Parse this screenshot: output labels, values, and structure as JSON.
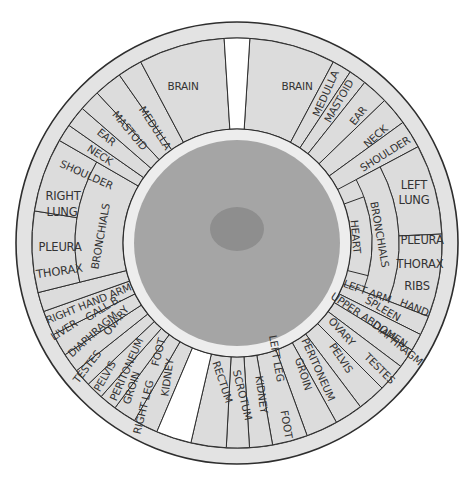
{
  "chart_data": {
    "type": "iris-zone-chart",
    "center": [
      237,
      243
    ],
    "radii": {
      "rim_outer": 221,
      "ring_outer": 205,
      "ring_inner": 114,
      "iris": 103,
      "pupil_rx": 27,
      "pupil_ry": 22
    },
    "colors": {
      "rim": "#e3e3e3",
      "segment": "#dcdcdc",
      "gap": "#ffffff",
      "iris_ring": "#ededed",
      "iris": "#a5a5a5",
      "pupil": "#8e8e8e",
      "line": "#2e2e2e",
      "text": "#333333"
    },
    "gaps": [
      {
        "name": "top-gap",
        "a0": -3.6,
        "a1": 3.6
      },
      {
        "name": "bottom-gap",
        "a0": 193,
        "a1": 203
      }
    ],
    "right_half": [
      {
        "label": "BRAIN",
        "a0": 3.6,
        "a1": 28,
        "r0": 114,
        "r1": 205
      },
      {
        "label": "MEDULLA",
        "a0": 28,
        "a1": 33.5,
        "r0": 114,
        "r1": 205
      },
      {
        "label": "MASTOID",
        "a0": 33.5,
        "a1": 38.5,
        "r0": 114,
        "r1": 205
      },
      {
        "label": "EAR",
        "a0": 38.5,
        "a1": 46,
        "r0": 114,
        "r1": 205
      },
      {
        "label": "NECK",
        "a0": 46,
        "a1": 54,
        "r0": 114,
        "r1": 205
      },
      {
        "label": "SHOULDER",
        "a0": 54,
        "a1": 62,
        "r0": 114,
        "r1": 205
      },
      {
        "label": "LEFT LUNG",
        "a0": 62,
        "a1": 87.5,
        "r0": 162,
        "r1": 205
      },
      {
        "label": "PLEURA THORAX RIBS",
        "a0": 87.5,
        "a1": 111,
        "r0": 162,
        "r1": 205
      },
      {
        "label": "BRONCHIALS",
        "a0": 62,
        "a1": 111,
        "r0": 135,
        "r1": 162
      },
      {
        "label": "HEART",
        "a0": 70,
        "a1": 104,
        "r0": 114,
        "r1": 135
      },
      {
        "label": "LEFT ARM / HAND",
        "a0": 111,
        "a1": 116.5,
        "r0": 114,
        "r1": 205
      },
      {
        "label": "SPLEEN",
        "a0": 116.5,
        "a1": 121.5,
        "r0": 114,
        "r1": 205
      },
      {
        "label": "UPPER ABDOMEN / DIAPHRAGM",
        "a0": 121.5,
        "a1": 127,
        "r0": 114,
        "r1": 205
      },
      {
        "label": "OVARY / TESTES",
        "a0": 127,
        "a1": 135,
        "r0": 114,
        "r1": 205
      },
      {
        "label": "PELVIS",
        "a0": 135,
        "a1": 143,
        "r0": 114,
        "r1": 205
      },
      {
        "label": "PERITONEUM",
        "a0": 143,
        "a1": 151,
        "r0": 114,
        "r1": 205
      },
      {
        "label": "GROIN",
        "a0": 151,
        "a1": 160,
        "r0": 114,
        "r1": 205
      },
      {
        "label": "LEFT LEG / FOOT",
        "a0": 160,
        "a1": 170,
        "r0": 114,
        "r1": 205
      },
      {
        "label": "KIDNEY",
        "a0": 170,
        "a1": 176.5,
        "r0": 114,
        "r1": 205
      },
      {
        "label": "SCROTUM",
        "a0": 176.5,
        "a1": 183,
        "r0": 114,
        "r1": 205
      },
      {
        "label": "RECTUM",
        "a0": 183,
        "a1": 193,
        "r0": 114,
        "r1": 205
      }
    ],
    "left_half": [
      {
        "label": "KIDNEY",
        "a0": 203,
        "a1": 210,
        "r0": 114,
        "r1": 205
      },
      {
        "label": "RIGHT LEG / FOOT",
        "a0": 210,
        "a1": 216.5,
        "r0": 114,
        "r1": 205
      },
      {
        "label": "GROIN",
        "a0": 216.5,
        "a1": 221.5,
        "r0": 114,
        "r1": 205
      },
      {
        "label": "PERITONEUM",
        "a0": 221.5,
        "a1": 226.5,
        "r0": 114,
        "r1": 205
      },
      {
        "label": "PELVIS",
        "a0": 226.5,
        "a1": 231.5,
        "r0": 114,
        "r1": 205
      },
      {
        "label": "TESTES / OVARY",
        "a0": 231.5,
        "a1": 237,
        "r0": 114,
        "r1": 205
      },
      {
        "label": "DIAPHRAGM",
        "a0": 237,
        "a1": 243.5,
        "r0": 114,
        "r1": 205
      },
      {
        "label": "LIVER / GALL B.",
        "a0": 243.5,
        "a1": 250.5,
        "r0": 114,
        "r1": 205
      },
      {
        "label": "RIGHT HAND ARM",
        "a0": 250.5,
        "a1": 256,
        "r0": 114,
        "r1": 205
      },
      {
        "label": "PLEURA THORAX",
        "a0": 256,
        "a1": 279,
        "r0": 162,
        "r1": 205
      },
      {
        "label": "RIGHT LUNG",
        "a0": 279,
        "a1": 300,
        "r0": 162,
        "r1": 205
      },
      {
        "label": "BRONCHIALS",
        "a0": 256,
        "a1": 300,
        "r0": 114,
        "r1": 162
      },
      {
        "label": "SHOULDER",
        "a0": 300,
        "a1": 305,
        "r0": 114,
        "r1": 205
      },
      {
        "label": "NECK",
        "a0": 305,
        "a1": 311,
        "r0": 114,
        "r1": 205
      },
      {
        "label": "EAR",
        "a0": 311,
        "a1": 317,
        "r0": 114,
        "r1": 205
      },
      {
        "label": "MASTOID",
        "a0": 317,
        "a1": 325,
        "r0": 114,
        "r1": 205
      },
      {
        "label": "MEDULLA",
        "a0": 325,
        "a1": 332,
        "r0": 114,
        "r1": 205
      },
      {
        "label": "BRAIN",
        "a0": 332,
        "a1": 356.4,
        "r0": 114,
        "r1": 205
      }
    ]
  },
  "labels": {
    "brain_left": "BRAIN",
    "brain_right": "BRAIN",
    "medulla_l": "MEDULLA",
    "mastoid_l": "MASTOID",
    "ear_l": "EAR",
    "neck_l": "NECK",
    "shoulder_l": "SHOULDER",
    "right_lung_1": "RIGHT",
    "right_lung_2": "LUNG",
    "pleura_l": "PLEURA",
    "thorax_l": "THORAX",
    "bronchials_l": "BRONCHIALS",
    "right_hand_arm": "RIGHT HAND ARM",
    "liver": "LIVER",
    "gall_b": "GALL B.",
    "diaphragm_l": "DIAPHRAGM",
    "testes_l": "TESTES",
    "ovary_l": "OVARY",
    "pelvis_l": "PELVIS",
    "peritoneum_l": "PERITONEUM",
    "groin_l": "GROIN",
    "right_leg": "RIGHT LEG",
    "foot_l": "FOOT",
    "kidney_l": "KIDNEY",
    "medulla_r": "MEDULLA",
    "mastoid_r": "MASTOID",
    "ear_r": "EAR",
    "neck_r": "NECK",
    "shoulder_r": "SHOULDER",
    "left_lung_1": "LEFT",
    "left_lung_2": "LUNG",
    "pleura_r": "PLEURA",
    "thorax_r": "THORAX",
    "ribs": "RIBS",
    "bronchials_r": "BRONCHIALS",
    "heart": "HEART",
    "left_arm": "LEFT ARM",
    "hand": "HAND",
    "spleen": "SPLEEN",
    "upper_abdomen": "UPPER ABDOMEN",
    "diaphragm_r": "DIAPHRAGM",
    "ovary_r": "OVARY",
    "testes_r": "TESTES",
    "pelvis_r": "PELVIS",
    "peritoneum_r": "PERITONEUM",
    "groin_r": "GROIN",
    "left_leg": "LEFT LEG",
    "foot_r": "FOOT",
    "kidney_r": "KIDNEY",
    "scrotum": "SCROTUM",
    "rectum": "RECTUM"
  }
}
